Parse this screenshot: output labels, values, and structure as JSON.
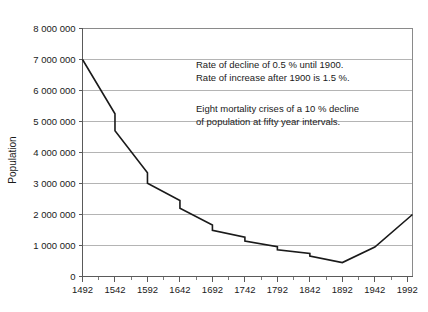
{
  "chart_data": {
    "type": "line",
    "title": "",
    "xlabel": "",
    "ylabel": "Population",
    "xlim": [
      1492,
      2000
    ],
    "ylim": [
      0,
      8000000
    ],
    "ytick_step": 1000000,
    "xtick_step": 50,
    "grid": true,
    "legend": "none",
    "series_color": "#1a1a1a",
    "grid_color": "#b4b4b4",
    "frame_color": "#8a8a8a",
    "y_ticks": [
      {
        "value": 0,
        "label": "0"
      },
      {
        "value": 1000000,
        "label": "1 000 000"
      },
      {
        "value": 2000000,
        "label": "2 000 000"
      },
      {
        "value": 3000000,
        "label": "3 000 000"
      },
      {
        "value": 4000000,
        "label": "4 000 000"
      },
      {
        "value": 5000000,
        "label": "5 000 000"
      },
      {
        "value": 6000000,
        "label": "6 000 000"
      },
      {
        "value": 7000000,
        "label": "7 000 000"
      },
      {
        "value": 8000000,
        "label": "8 000 000"
      }
    ],
    "x_ticks": [
      {
        "value": 1492,
        "label": "1492"
      },
      {
        "value": 1542,
        "label": "1542"
      },
      {
        "value": 1592,
        "label": "1592"
      },
      {
        "value": 1642,
        "label": "1642"
      },
      {
        "value": 1692,
        "label": "1692"
      },
      {
        "value": 1742,
        "label": "1742"
      },
      {
        "value": 1792,
        "label": "1792"
      },
      {
        "value": 1842,
        "label": "1842"
      },
      {
        "value": 1892,
        "label": "1892"
      },
      {
        "value": 1942,
        "label": "1942"
      },
      {
        "value": 1992,
        "label": "1992"
      }
    ],
    "x_minor_ticks": [
      1517,
      1567,
      1617,
      1667,
      1717,
      1767,
      1817,
      1867,
      1917,
      1967
    ],
    "points": [
      {
        "x": 1492,
        "y": 7000000
      },
      {
        "x": 1542,
        "y": 5250000
      },
      {
        "x": 1542,
        "y": 4700000
      },
      {
        "x": 1592,
        "y": 3350000
      },
      {
        "x": 1592,
        "y": 3010000
      },
      {
        "x": 1642,
        "y": 2450000
      },
      {
        "x": 1642,
        "y": 2200000
      },
      {
        "x": 1692,
        "y": 1660000
      },
      {
        "x": 1692,
        "y": 1490000
      },
      {
        "x": 1742,
        "y": 1270000
      },
      {
        "x": 1742,
        "y": 1140000
      },
      {
        "x": 1792,
        "y": 960000
      },
      {
        "x": 1792,
        "y": 860000
      },
      {
        "x": 1842,
        "y": 740000
      },
      {
        "x": 1842,
        "y": 660000
      },
      {
        "x": 1892,
        "y": 450000
      },
      {
        "x": 1942,
        "y": 950000
      },
      {
        "x": 2000,
        "y": 2000000
      }
    ],
    "crisis_years": [
      1542,
      1592,
      1642,
      1692,
      1742,
      1792,
      1842,
      1892
    ],
    "annotations": [
      {
        "id": "rates",
        "lines": [
          "Rate of decline of 0.5 % until 1900.",
          "Rate of increase after 1900 is 1.5 %."
        ]
      },
      {
        "id": "crises",
        "lines": [
          "Eight mortality crises of a 10 % decline",
          "of population at fifty year intervals."
        ]
      }
    ]
  }
}
